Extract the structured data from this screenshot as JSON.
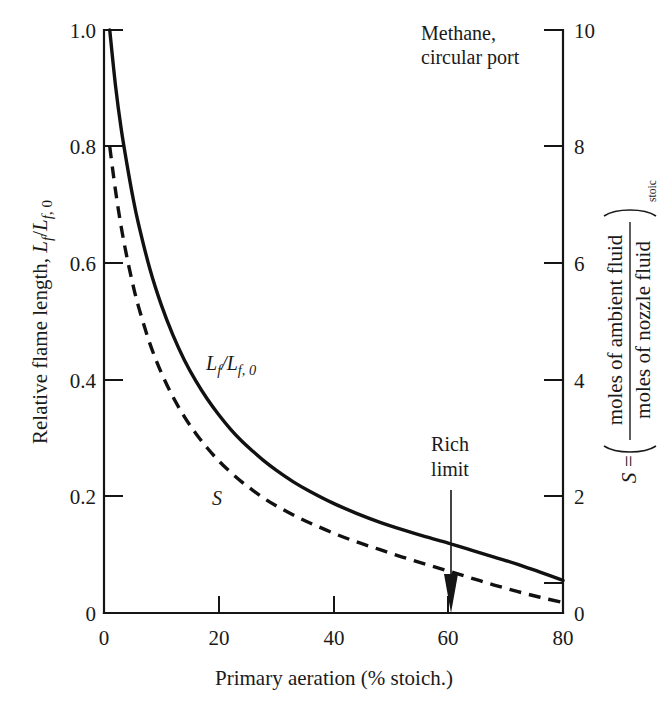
{
  "figure": {
    "annotation_note_line1": "Methane,",
    "annotation_note_line2": "circular port",
    "rich_limit_line1": "Rich",
    "rich_limit_line2": "limit",
    "rich_limit_x": 61
  },
  "chart_data": {
    "type": "line",
    "title": "",
    "subtitle": "",
    "xlabel": "Primary aeration (% stoich.)",
    "ylabel": "Relative flame length, Lf/Lf, 0",
    "ylabel_right": "S = (moles of ambient fluid / moles of nozzle fluid)stoic",
    "ylabel_right_parts": {
      "symbol": "S",
      "equals": "=",
      "numerator": "moles of ambient fluid",
      "denominator": "moles of nozzle fluid",
      "subscript": "stoic"
    },
    "xlim": [
      0,
      80
    ],
    "ylim": [
      0,
      1.0
    ],
    "ylim_right": [
      0,
      10
    ],
    "xticks": [
      0,
      20,
      40,
      60,
      80
    ],
    "xtick_labels": [
      "0",
      "20",
      "40",
      "60",
      "80"
    ],
    "yticks": [
      0,
      0.2,
      0.4,
      0.6,
      0.8,
      1.0
    ],
    "ytick_labels": [
      "0",
      "0.2",
      "0.4",
      "0.6",
      "0.8",
      "1.0"
    ],
    "yticks_right": [
      0,
      2,
      4,
      6,
      8,
      10
    ],
    "ytick_labels_right": [
      "0",
      "2",
      "4",
      "6",
      "8",
      "10"
    ],
    "grid": false,
    "legend_position": "inline-curve-labels",
    "series": [
      {
        "name": "Lf/Lf, 0",
        "label": "Lf/Lf, 0",
        "style": "solid",
        "axis": "left",
        "label_x": 21,
        "label_y": 0.4,
        "x": [
          1,
          2,
          3,
          4,
          5,
          6,
          8,
          10,
          12,
          14,
          16,
          18,
          20,
          22,
          24,
          26,
          28,
          30,
          33,
          36,
          40,
          44,
          48,
          52,
          56,
          60,
          64,
          68,
          72,
          76,
          80
        ],
        "y": [
          1.0,
          0.905,
          0.83,
          0.77,
          0.715,
          0.668,
          0.59,
          0.528,
          0.477,
          0.434,
          0.398,
          0.367,
          0.34,
          0.316,
          0.295,
          0.277,
          0.26,
          0.245,
          0.225,
          0.208,
          0.188,
          0.171,
          0.156,
          0.143,
          0.131,
          0.12,
          0.108,
          0.096,
          0.084,
          0.07,
          0.056
        ]
      },
      {
        "name": "S",
        "label": "S",
        "style": "dashed",
        "axis": "right",
        "label_x": 16,
        "label_y": 0.2,
        "x": [
          1,
          2,
          3,
          4,
          5,
          6,
          8,
          10,
          12,
          14,
          16,
          18,
          20,
          22,
          24,
          26,
          28,
          30,
          33,
          36,
          40,
          44,
          48,
          52,
          56,
          60,
          64,
          68,
          72,
          76,
          80
        ],
        "y_right": [
          8.0,
          7.25,
          6.62,
          6.1,
          5.65,
          5.26,
          4.62,
          4.12,
          3.71,
          3.37,
          3.08,
          2.83,
          2.61,
          2.42,
          2.25,
          2.1,
          1.96,
          1.84,
          1.68,
          1.54,
          1.37,
          1.22,
          1.09,
          0.96,
          0.84,
          0.72,
          0.6,
          0.48,
          0.37,
          0.27,
          0.18
        ]
      }
    ],
    "annotations": [
      {
        "name": "rich-limit",
        "text": "Rich limit",
        "x": 61,
        "arrow_to_y": 0.0
      },
      {
        "name": "methane-note",
        "text": "Methane, circular port"
      }
    ]
  },
  "colors": {
    "ink": "#111111",
    "background": "#ffffff"
  }
}
